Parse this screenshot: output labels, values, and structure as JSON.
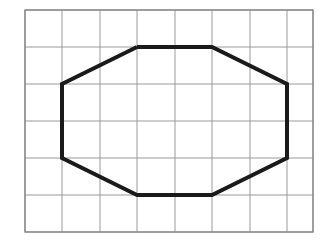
{
  "figure": {
    "canvas": {
      "width": 326,
      "height": 246,
      "background": "#ffffff"
    },
    "grid": {
      "label": "grid",
      "columns": 8,
      "rows": 6,
      "x_lines": [
        25,
        62,
        100,
        137,
        175,
        212,
        250,
        287,
        313
      ],
      "y_lines": [
        10,
        47,
        84,
        121,
        158,
        195,
        232
      ],
      "cell_width": 37.5,
      "cell_height": 37,
      "line_color": "#9a9a9a",
      "border_color": "#8a8a8a",
      "line_width": 1,
      "border_width": 1.4
    },
    "shape": {
      "label": "octagon",
      "type": "polygon",
      "sides": 8,
      "stroke_color": "#1a1a1a",
      "stroke_width": 4,
      "fill": "none",
      "points": [
        {
          "name": "top-left",
          "x": 137,
          "y": 47
        },
        {
          "name": "top-right",
          "x": 212,
          "y": 47
        },
        {
          "name": "right-top",
          "x": 287,
          "y": 84
        },
        {
          "name": "right-bottom",
          "x": 287,
          "y": 158
        },
        {
          "name": "bottom-right",
          "x": 212,
          "y": 195
        },
        {
          "name": "bottom-left",
          "x": 137,
          "y": 195
        },
        {
          "name": "left-bottom",
          "x": 62,
          "y": 158
        },
        {
          "name": "left-top",
          "x": 62,
          "y": 84
        }
      ],
      "points_attr": "137,47 212,47 287,84 287,158 212,195 137,195 62,158 62,84"
    }
  }
}
